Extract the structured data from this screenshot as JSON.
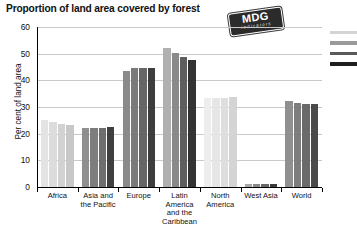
{
  "title": "Proportion of land area covered by forest",
  "badge": {
    "main": "MDG",
    "sub": "indicators"
  },
  "chart_data": {
    "type": "bar",
    "title": "Proportion of land area covered by forest",
    "xlabel": "",
    "ylabel": "Per cent of land area",
    "ylim": [
      0,
      60
    ],
    "yticks": [
      0,
      10,
      20,
      30,
      40,
      50,
      60
    ],
    "grid": true,
    "legend": "right-edge-clipped",
    "categories": [
      "Africa",
      "Asia and the Pacific",
      "Europe",
      "Latin America and the Caribbean",
      "North America",
      "West Asia",
      "World"
    ],
    "series": [
      {
        "name": "series-1",
        "color": "#d8d8d8",
        "values": [
          25.3,
          22.2,
          43.6,
          52.0,
          33.5,
          1.3,
          32.1
        ]
      },
      {
        "name": "series-2",
        "color": "#b5b5b5",
        "values": [
          24.2,
          22.2,
          44.6,
          50.1,
          33.5,
          1.2,
          31.6
        ]
      },
      {
        "name": "series-3",
        "color": "#8c8c8c",
        "values": [
          23.6,
          22.3,
          44.6,
          48.6,
          33.5,
          1.1,
          31.2
        ]
      },
      {
        "name": "series-4",
        "color": "#4d4d4d",
        "values": [
          23.1,
          22.4,
          44.5,
          47.6,
          33.6,
          1.1,
          31.1
        ]
      }
    ],
    "group_palettes": [
      [
        "#e3e3e3",
        "#dcdcdc",
        "#d2d2d2",
        "#c8c8c8"
      ],
      [
        "#8f8f8f",
        "#7d7d7d",
        "#6e6e6e",
        "#3f3f3f"
      ],
      [
        "#8a8a8a",
        "#7a7a7a",
        "#666666",
        "#3d3d3d"
      ],
      [
        "#b0b0b0",
        "#8a8a8a",
        "#5e5e5e",
        "#333333"
      ],
      [
        "#ededed",
        "#e6e6e6",
        "#dedede",
        "#d4d4d4"
      ],
      [
        "#a8a8a8",
        "#8a8a8a",
        "#6a6a6a",
        "#3a3a3a"
      ],
      [
        "#8f8f8f",
        "#7d7d7d",
        "#6a6a6a",
        "#4a4a4a"
      ]
    ]
  },
  "legend_swatches": [
    "#d4d4d4",
    "#9a9a9a",
    "#5a5a5a",
    "#1f1f1f"
  ]
}
